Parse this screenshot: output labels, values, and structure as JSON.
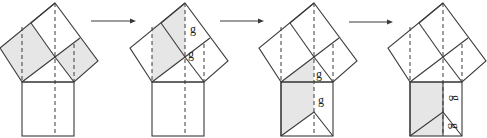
{
  "diagram": {
    "title": "Shear-based proof of the Pythagorean theorem (4 stages)",
    "colors": {
      "stroke": "#3a3a3a",
      "shade": "#e6e6e6",
      "background": "#ffffff",
      "label": "#222222"
    },
    "arrows": [
      {
        "x1": 91,
        "x2": 136,
        "y": 21
      },
      {
        "x1": 220,
        "x2": 264,
        "y": 21
      },
      {
        "x1": 349,
        "x2": 393,
        "y": 22
      }
    ],
    "panels": [
      {
        "offset": 0,
        "shaded": [
          [
            [
              0,
              48
            ],
            [
              31,
              23
            ],
            [
              55,
              57
            ],
            [
              22,
              82
            ]
          ],
          [
            [
              55,
              57
            ],
            [
              80,
              38
            ],
            [
              98,
              61
            ],
            [
              74,
              82
            ]
          ]
        ],
        "labels": []
      },
      {
        "offset": 130,
        "shaded": [
          [
            [
              22,
              82
            ],
            [
              22,
              27
            ],
            [
              31,
              23
            ],
            [
              55,
              3
            ],
            [
              55,
              57
            ]
          ]
        ],
        "labels": [
          {
            "text": "g",
            "x": 63,
            "y": 33,
            "rotate": 0
          },
          {
            "text": "g",
            "x": 61,
            "y": 58,
            "rotate": 0
          }
        ]
      },
      {
        "offset": 259,
        "shaded": [
          [
            [
              22,
              82
            ],
            [
              55,
              57
            ],
            [
              55,
              112
            ],
            [
              22,
              136
            ]
          ]
        ],
        "labels": [
          {
            "text": "g",
            "x": 60,
            "y": 78,
            "rotate": 0
          },
          {
            "text": "g",
            "x": 62,
            "y": 104,
            "rotate": 0
          }
        ]
      },
      {
        "offset": 388,
        "shaded": [
          [
            [
              22,
              82
            ],
            [
              55,
              82
            ],
            [
              55,
              136
            ],
            [
              22,
              136
            ]
          ]
        ],
        "labels": [
          {
            "text": "g",
            "x": 64,
            "y": 98,
            "rotate": 90
          },
          {
            "text": "g",
            "x": 63,
            "y": 126,
            "rotate": 90
          }
        ]
      }
    ],
    "base_geometry": {
      "top": [
        55,
        3
      ],
      "left": [
        0,
        48
      ],
      "right": [
        98,
        61
      ],
      "apex": [
        55,
        57
      ],
      "hyp_left": [
        22,
        82
      ],
      "hyp_right": [
        74,
        82
      ],
      "left_mid": [
        31,
        23
      ],
      "right_mid": [
        80,
        38
      ],
      "square_bottom": 136,
      "inner_apex_y": 112
    },
    "label_text": "g"
  }
}
